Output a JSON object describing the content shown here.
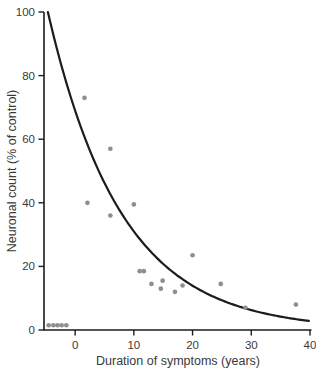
{
  "chart_data": {
    "type": "scatter",
    "title": "",
    "xlabel": "Duration of symptoms (years)",
    "ylabel": "Neuronal count (% of control)",
    "xlim": [
      -5.3,
      40
    ],
    "ylim": [
      0,
      100
    ],
    "x_ticks": [
      0,
      10,
      20,
      30,
      40
    ],
    "y_ticks": [
      0,
      20,
      40,
      60,
      80,
      100
    ],
    "grid": false,
    "legend": "none",
    "points": [
      [
        -4.5,
        1.5
      ],
      [
        -3.7,
        1.5
      ],
      [
        -3.0,
        1.5
      ],
      [
        -2.3,
        1.5
      ],
      [
        -1.5,
        1.5
      ],
      [
        1.6,
        73
      ],
      [
        2.1,
        40
      ],
      [
        6.0,
        57
      ],
      [
        6.0,
        36
      ],
      [
        10.0,
        39.5
      ],
      [
        11.0,
        18.5
      ],
      [
        11.7,
        18.5
      ],
      [
        13.0,
        14.5
      ],
      [
        14.6,
        13.0
      ],
      [
        14.9,
        15.5
      ],
      [
        17.0,
        12.0
      ],
      [
        18.3,
        14.0
      ],
      [
        20.0,
        23.5
      ],
      [
        24.8,
        14.5
      ],
      [
        29.0,
        7.0
      ],
      [
        37.6,
        8.0
      ]
    ],
    "trend_curve": {
      "type": "exponential_decay",
      "formula": "y = 69 * exp(-0.08 * x), clipped at y = 100",
      "a": 69,
      "k": 0.08,
      "x_end": 40,
      "clip_max": 100
    },
    "styles": {
      "point_color": "#8f8f8f",
      "curve_color": "#1c1c1c",
      "axis_color": "#1c1c1c",
      "text_color": "#3a3a3a",
      "background": "#ffffff"
    }
  }
}
